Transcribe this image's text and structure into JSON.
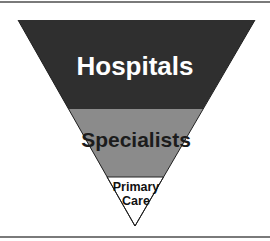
{
  "diagram": {
    "type": "inverted-pyramid",
    "tiers": [
      {
        "label": "Hospitals",
        "fill": "#2f2f2f",
        "text_color": "#ffffff"
      },
      {
        "label": "Specialists",
        "fill": "#8b8b8b",
        "text_color": "#1c1c1c"
      },
      {
        "label_lines": [
          "Primary",
          "Care"
        ],
        "fill": "#ffffff",
        "text_color": "#111111"
      }
    ],
    "rule_color": "#7a7a7a",
    "outline_color": "#222222"
  }
}
